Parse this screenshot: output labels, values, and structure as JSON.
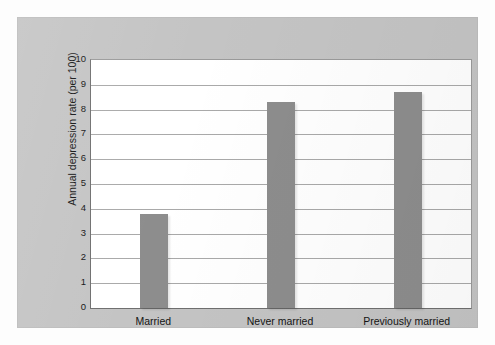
{
  "chart_data": {
    "type": "bar",
    "title": "",
    "subtitle": "",
    "xlabel": "",
    "ylabel": "Annual depression rate (per 100)",
    "categories": [
      "Married",
      "Never married",
      "Previously married"
    ],
    "values": [
      3.8,
      8.3,
      8.7
    ],
    "series": [
      {
        "name": "Annual depression rate (per 100)",
        "values": [
          3.8,
          8.3,
          8.7
        ]
      }
    ],
    "ylim": [
      0,
      10
    ],
    "ytick_labels": [
      "10",
      "9",
      "8",
      "7",
      "6",
      "5",
      "4",
      "3",
      "2",
      "1",
      "0"
    ],
    "ytick_values": [
      10,
      9,
      8,
      7,
      6,
      5,
      4,
      3,
      2,
      1,
      0
    ],
    "grid": true,
    "grid_axis": "y",
    "legend": false,
    "legend_position": "none",
    "bar_color": "#8d8d8d",
    "plot_background": "#ffffff",
    "figure_background": "#c4c4c4",
    "gridline_color": "#a9a9a9",
    "axis_color": "#6f6f6f",
    "text_color": "#141414"
  }
}
